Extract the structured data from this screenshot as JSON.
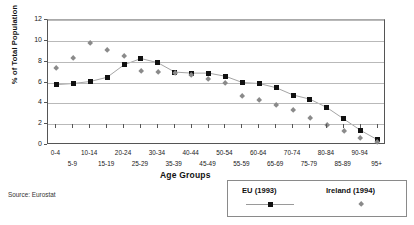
{
  "chart_data": {
    "type": "scatter",
    "title": "",
    "xlabel": "Age Groups",
    "ylabel": "% of Total Population",
    "ylim": [
      0,
      12
    ],
    "ytick_labels": [
      "0",
      "2",
      "4",
      "6",
      "8",
      "10",
      "12"
    ],
    "ytick_values": [
      0,
      2,
      4,
      6,
      8,
      10,
      12
    ],
    "grid": true,
    "legend_position": "below-right",
    "categories": [
      "0-4",
      "5-9",
      "10-14",
      "15-19",
      "20-24",
      "25-29",
      "30-34",
      "35-39",
      "40-44",
      "45-49",
      "50-54",
      "55-59",
      "60-64",
      "65-69",
      "70-74",
      "75-79",
      "80-84",
      "85-89",
      "90-94",
      "95+"
    ],
    "series": [
      {
        "name": "EU (1993)",
        "marker": "square",
        "color": "#111111",
        "line": true,
        "values": [
          5.8,
          5.9,
          6.1,
          6.5,
          7.7,
          8.3,
          7.9,
          7.0,
          6.9,
          6.9,
          6.6,
          6.0,
          5.9,
          5.5,
          4.8,
          4.4,
          3.6,
          2.5,
          1.4,
          0.5
        ]
      },
      {
        "name": "Ireland (1994)",
        "marker": "diamond",
        "color": "#8a8a8a",
        "line": false,
        "values": [
          7.4,
          8.3,
          9.8,
          9.1,
          8.5,
          7.1,
          7.0,
          6.9,
          6.7,
          6.3,
          5.9,
          4.7,
          4.3,
          3.8,
          3.3,
          2.6,
          1.9,
          1.3,
          0.7,
          0.3
        ]
      }
    ]
  },
  "axis": {
    "x_labels_top": [
      "0-4",
      "10-14",
      "20-24",
      "30-34",
      "40-44",
      "50-54",
      "60-64",
      "70-74",
      "80-84",
      "90-94"
    ],
    "x_labels_bottom": [
      "5-9",
      "15-19",
      "25-29",
      "35-39",
      "45-49",
      "55-59",
      "65-69",
      "75-79",
      "85-89",
      "95+"
    ],
    "x_title": "Age Groups",
    "y_title": "% of Total Population"
  },
  "legend": {
    "eu_label": "EU (1993)",
    "ireland_label": "Ireland (1994)"
  },
  "footer": {
    "source": "Source: Eurostat"
  }
}
